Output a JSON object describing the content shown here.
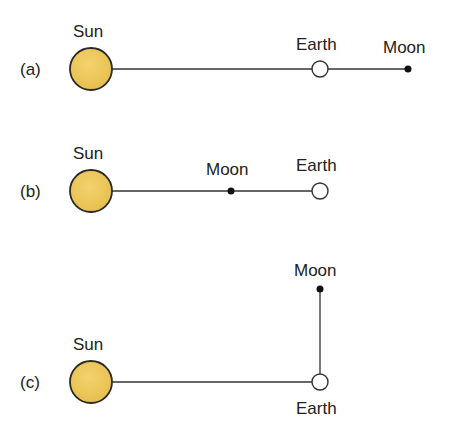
{
  "colors": {
    "sun_fill": "#eec85a",
    "sun_stroke": "#2a2a2a",
    "line": "#333333",
    "text": "#222222"
  },
  "panels": [
    {
      "label": "(a)",
      "sun": "Sun",
      "earth": "Earth",
      "moon": "Moon"
    },
    {
      "label": "(b)",
      "sun": "Sun",
      "moon": "Moon",
      "earth": "Earth"
    },
    {
      "label": "(c)",
      "sun": "Sun",
      "moon": "Moon",
      "earth": "Earth"
    }
  ]
}
